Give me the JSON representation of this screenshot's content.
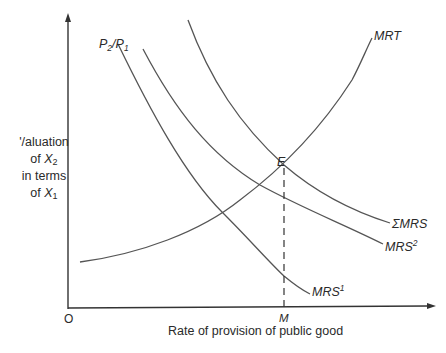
{
  "diagram": {
    "type": "economics-curve-diagram",
    "y_axis": {
      "top_label": "P2/P1",
      "side_label_lines": [
        "'/aluation",
        "of X2",
        "in terms",
        "of X1"
      ]
    },
    "x_axis": {
      "label": "Rate of provision of public good",
      "origin_label": "O",
      "tick_label": "M"
    },
    "curves": [
      {
        "id": "MRT",
        "label": "MRT",
        "shape": "upward-sloping convex"
      },
      {
        "id": "SUM_MRS",
        "label": "ΣMRS",
        "shape": "downward-sloping convex"
      },
      {
        "id": "MRS2",
        "label": "MRS",
        "superscript": "2",
        "shape": "downward-sloping convex"
      },
      {
        "id": "MRS1",
        "label": "MRS",
        "superscript": "1",
        "shape": "downward-sloping convex"
      }
    ],
    "equilibrium": {
      "point_label": "E",
      "description": "Intersection of MRT and ΣMRS; dashed vertical line drops to M on the x-axis"
    },
    "colors": {
      "curve": "#555555",
      "axis": "#333333",
      "text": "#2a2a2a",
      "background": "#ffffff"
    }
  }
}
